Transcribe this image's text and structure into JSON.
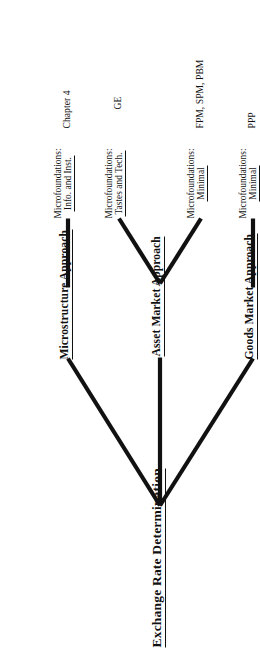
{
  "diagram": {
    "title": "Exchange Rate Determination",
    "orientation_note": "rotated",
    "line_color": "#111111",
    "text_color": "#111111",
    "branches": [
      {
        "id": "goods-market",
        "approach": "Goods Market Approach",
        "micro_lead": "Microfoundations:",
        "micro_value": "Minimal",
        "models": "PPP"
      },
      {
        "id": "asset-market",
        "approach": "Asset Market Approach",
        "sub": [
          {
            "id": "asset-minimal",
            "micro_lead": "Microfoundations:",
            "micro_value": "Minimal",
            "models": "FPM, SPM, PBM"
          },
          {
            "id": "asset-tastes-tech",
            "micro_lead": "Microfoundations:",
            "micro_value": "Tastes and Tech.",
            "models": "GE"
          }
        ]
      },
      {
        "id": "microstructure",
        "approach": "Microstructure Approach",
        "micro_lead": "Microfoundations:",
        "micro_value": "Info. and Inst.",
        "models": "Chapter 4"
      }
    ]
  }
}
